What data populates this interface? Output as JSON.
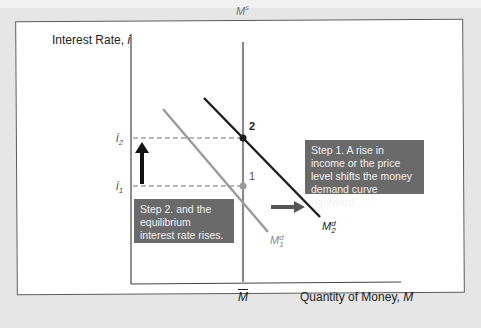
{
  "axes": {
    "y_label": "Interest Rate, ",
    "y_symbol": "i",
    "x_label": "Quantity of Money, ",
    "x_symbol": "M",
    "x_tick": "M"
  },
  "curves": {
    "supply": {
      "label": "M",
      "sup": "s",
      "color": "#8a8a8a"
    },
    "demand1": {
      "label": "M",
      "sup": "d",
      "sub": "1",
      "color": "#9a9a9a"
    },
    "demand2": {
      "label": "M",
      "sup": "d",
      "sub": "2",
      "color": "#1e1e1e"
    }
  },
  "ticks": {
    "i2": {
      "label": "i",
      "sub": "2"
    },
    "i1": {
      "label": "i",
      "sub": "1"
    }
  },
  "points": {
    "p1": {
      "label": "1"
    },
    "p2": {
      "label": "2"
    }
  },
  "annotations": {
    "step1": "Step 1. A rise in income or the price level shifts the money demand curve rightward . . .",
    "step2": "Step 2. and the equilibrium interest rate rises."
  },
  "colors": {
    "step_box": "#6a6a6a",
    "arrow_up": "#111111",
    "arrow_right": "#555555"
  }
}
